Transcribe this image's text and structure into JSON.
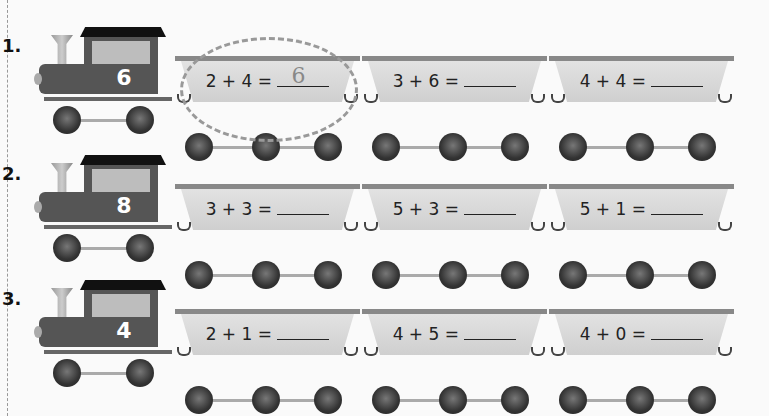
{
  "problems": [
    {
      "number": "1.",
      "engine_value": "6",
      "cars": [
        {
          "equation": "2 + 4 =",
          "answer": "6",
          "circled": true
        },
        {
          "equation": "3 + 6 =",
          "answer": ""
        },
        {
          "equation": "4 + 4 =",
          "answer": ""
        }
      ]
    },
    {
      "number": "2.",
      "engine_value": "8",
      "cars": [
        {
          "equation": "3 + 3 =",
          "answer": ""
        },
        {
          "equation": "5 + 3 =",
          "answer": ""
        },
        {
          "equation": "5 + 1 =",
          "answer": ""
        }
      ]
    },
    {
      "number": "3.",
      "engine_value": "4",
      "cars": [
        {
          "equation": "2 + 1 =",
          "answer": ""
        },
        {
          "equation": "4 + 5 =",
          "answer": ""
        },
        {
          "equation": "4 + 0 =",
          "answer": ""
        }
      ]
    }
  ]
}
